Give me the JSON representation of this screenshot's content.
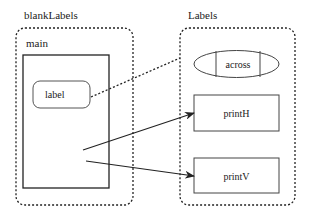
{
  "diagram": {
    "left_group": {
      "title": "blankLabels",
      "inner_title": "main",
      "child_label": "label"
    },
    "right_group": {
      "title": "Labels",
      "items": [
        "across",
        "printH",
        "printV"
      ]
    },
    "colors": {
      "stroke": "#222222",
      "background": "#ffffff"
    }
  }
}
